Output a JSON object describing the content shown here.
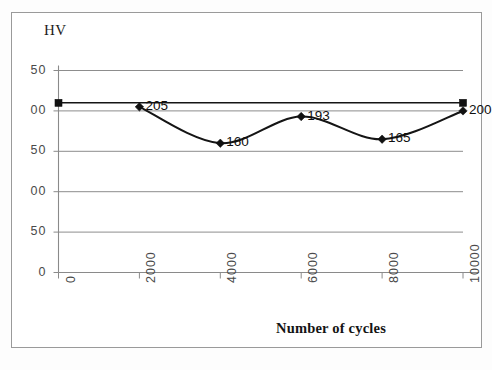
{
  "figure": {
    "y_axis_title": "HV",
    "x_axis_title": "Number of cycles"
  },
  "chart_data": {
    "type": "line",
    "title": "",
    "subtitle": "",
    "xlabel": "Number of cycles",
    "ylabel": "HV",
    "xlim": [
      0,
      10000
    ],
    "ylim": [
      0,
      250
    ],
    "x_ticks": [
      "0",
      "2000",
      "4000",
      "6000",
      "8000",
      "10000"
    ],
    "x_tick_values": [
      0,
      2000,
      4000,
      6000,
      8000,
      10000
    ],
    "y_ticks": [
      "250",
      "200",
      "150",
      "100",
      "50",
      "0"
    ],
    "y_tick_values": [
      250,
      200,
      150,
      100,
      50,
      0
    ],
    "y_ticks_clipped": [
      "50",
      "00",
      "50",
      "00",
      "50",
      "0"
    ],
    "grid": "horizontal",
    "legend": "none",
    "series": [
      {
        "name": "Hardness",
        "marker": "diamond",
        "color": "#111111",
        "x": [
          2000,
          4000,
          6000,
          8000,
          10000
        ],
        "values": [
          205,
          160,
          193,
          165,
          200
        ],
        "point_labels": [
          "205",
          "160",
          "193",
          "165",
          "200"
        ]
      },
      {
        "name": "Reference",
        "marker": "square",
        "color": "#111111",
        "x": [
          0,
          10000
        ],
        "values": [
          210,
          210
        ],
        "point_labels": [
          "",
          ""
        ]
      }
    ]
  }
}
